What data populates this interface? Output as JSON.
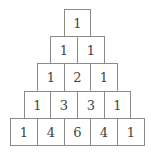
{
  "rows": [
    [
      1
    ],
    [
      1,
      1
    ],
    [
      1,
      2,
      1
    ],
    [
      1,
      3,
      3,
      1
    ],
    [
      1,
      4,
      6,
      4,
      1
    ]
  ],
  "colors": {
    "border": "#8a8a8a",
    "text": "#444444",
    "background": "#ffffff"
  }
}
